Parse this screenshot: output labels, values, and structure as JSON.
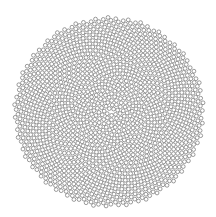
{
  "figure": {
    "background": "#ffffff",
    "pattern": {
      "type": "phyllotaxis",
      "center_x": 109,
      "center_y": 112,
      "count": 1500,
      "spacing": 2.45,
      "golden_angle_deg": 137.508,
      "circle_radius": 1.9,
      "stroke_color": "#7a7a7a",
      "fill_color": "#ffffff",
      "stroke_width": 0.75
    }
  }
}
